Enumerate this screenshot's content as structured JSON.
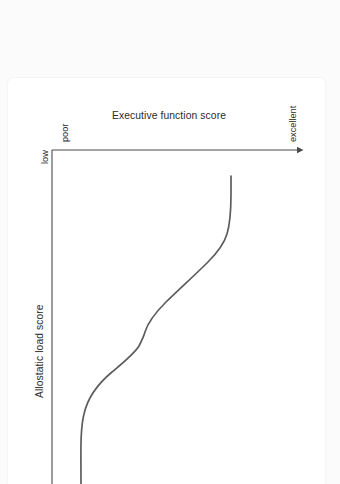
{
  "page": {
    "background_color": "#fbfbfb",
    "card_color": "#ffffff"
  },
  "article": {
    "rotated": true,
    "clipped": true,
    "lines": [
      {
        "text": "allostatic",
        "bold": true
      },
      {
        "text": "es on",
        "bold": true
      },
      {
        "text": "ests in",
        "bold": true
      },
      {
        "text": ", adults",
        "bold": true
      },
      {
        "text": "e in",
        "bold": true
      },
      {
        "text": "is chart",
        "bold": false
      },
      {
        "text": "body",
        "bold": false
      },
      {
        "text": "ed by allo-",
        "bold": false
      },
      {
        "text": "ltimately",
        "bold": false
      },
      {
        "text": "ioning in",
        "bold": false
      },
      {
        "text": "age 65),",
        "bold": false
      },
      {
        "text": "d others,",
        "bold": false
      }
    ]
  },
  "chart_data": {
    "type": "line",
    "title": "",
    "xlabel": "Executive function score",
    "ylabel": "Allostatic load score",
    "orientation": "rotated-90",
    "grid": false,
    "legend": null,
    "axis_color": "#4a4a4a",
    "line_color": "#5d5d5d",
    "x_tick_labels": [
      "poor",
      "excellent"
    ],
    "y_tick_labels": [
      "low"
    ],
    "xlim": [
      0,
      100
    ],
    "ylim": [
      0,
      100
    ],
    "series": [
      {
        "name": "Allostatic load vs executive function",
        "x": [
          2,
          2,
          3,
          6,
          12,
          20,
          28,
          38,
          48,
          58,
          68,
          78,
          86,
          92,
          95
        ],
        "y": [
          0,
          14,
          26,
          36,
          44,
          49,
          53,
          58,
          63,
          69,
          75,
          82,
          89,
          95,
          100
        ]
      }
    ]
  },
  "labels": {
    "x_axis_title": "Executive function score",
    "x_low": "poor",
    "x_high": "excellent",
    "y_axis_title": "Allostatic load score",
    "y_low": "low"
  }
}
